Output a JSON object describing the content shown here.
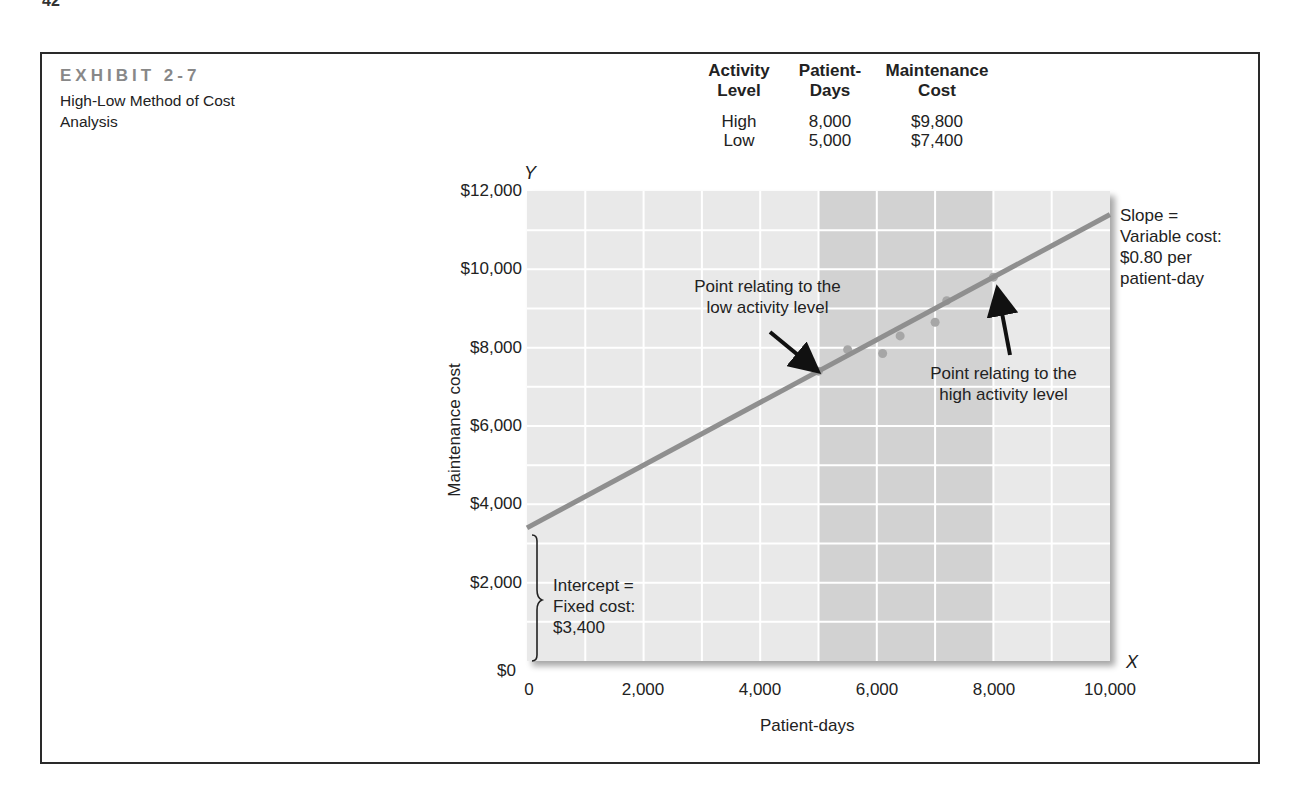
{
  "page": {
    "number": "42"
  },
  "exhibit": {
    "label": "EXHIBIT 2-7",
    "title": "High-Low Method of Cost Analysis"
  },
  "table": {
    "headers": [
      {
        "line1": "Activity",
        "line2": "Level"
      },
      {
        "line1": "Patient-",
        "line2": "Days"
      },
      {
        "line1": "Maintenance",
        "line2": "Cost"
      }
    ],
    "rows": [
      {
        "level": "High",
        "days": "8,000",
        "cost": "$9,800"
      },
      {
        "level": "Low",
        "days": "5,000",
        "cost": "$7,400"
      }
    ]
  },
  "chart_data": {
    "type": "scatter",
    "title": "High-Low Method of Cost Analysis",
    "xlabel": "Patient-days",
    "ylabel": "Maintenance cost",
    "x_axis_letter": "X",
    "y_axis_letter": "Y",
    "xlim": [
      0,
      10000
    ],
    "ylim": [
      0,
      12000
    ],
    "x_ticks": [
      "0",
      "2,000",
      "4,000",
      "6,000",
      "8,000",
      "10,000"
    ],
    "y_ticks": [
      "$0",
      "$2,000",
      "$4,000",
      "$6,000",
      "$8,000",
      "$10,000",
      "$12,000"
    ],
    "grid": true,
    "grid_step": {
      "x": 1000,
      "y": 1000
    },
    "shaded_band": {
      "x_from": 5000,
      "x_to": 8000
    },
    "series": [
      {
        "name": "Observations",
        "type": "scatter",
        "points": [
          {
            "x": 5000,
            "y": 7400
          },
          {
            "x": 5500,
            "y": 7950
          },
          {
            "x": 6100,
            "y": 7850
          },
          {
            "x": 6400,
            "y": 8300
          },
          {
            "x": 7000,
            "y": 8650
          },
          {
            "x": 7200,
            "y": 9200
          },
          {
            "x": 8000,
            "y": 9800
          }
        ]
      },
      {
        "name": "High-low cost line",
        "type": "line",
        "intercept": 3400,
        "slope": 0.8,
        "points": [
          {
            "x": 0,
            "y": 3400
          },
          {
            "x": 10000,
            "y": 11400
          }
        ]
      }
    ],
    "annotations": [
      {
        "text": "Point relating to the low activity level",
        "target": {
          "x": 5000,
          "y": 7400
        }
      },
      {
        "text": "Point relating to the high activity level",
        "target": {
          "x": 8000,
          "y": 9800
        }
      },
      {
        "text": "Slope = Variable cost: $0.80 per patient-day"
      },
      {
        "text": "Intercept = Fixed cost: $3,400"
      }
    ],
    "legend": "none"
  },
  "annotations": {
    "low_point": [
      "Point relating to the",
      "low activity level"
    ],
    "high_point": [
      "Point relating to the",
      "high activity level"
    ],
    "slope": [
      "Slope =",
      "Variable cost:",
      "$0.80 per",
      "patient-day"
    ],
    "intercept": [
      "Intercept =",
      "Fixed cost:",
      "$3,400"
    ]
  },
  "colors": {
    "plot_bg": "#e9e9e9",
    "band_bg": "#d2d2d2",
    "grid": "#ffffff",
    "line": "#8f8f8f",
    "points": "#a6a6a6",
    "text": "#222222",
    "exhibit_label": "#888888"
  }
}
